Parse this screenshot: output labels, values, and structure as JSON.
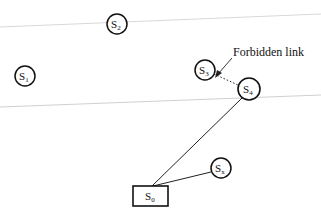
{
  "diagram": {
    "annotation": "Forbidden link",
    "boundaries": [
      {
        "x1": 0,
        "y1": 27,
        "x2": 321,
        "y2": 14,
        "color": "#d8d8d8"
      },
      {
        "x1": 0,
        "y1": 107,
        "x2": 321,
        "y2": 95,
        "color": "#d0d0d0"
      }
    ],
    "nodes": [
      {
        "id": "S2",
        "base": "S",
        "sub": "2",
        "shape": "circle",
        "cx": 117,
        "cy": 24,
        "r": 10
      },
      {
        "id": "S1",
        "base": "S",
        "sub": "1",
        "shape": "circle",
        "cx": 25,
        "cy": 76,
        "r": 10
      },
      {
        "id": "S3",
        "base": "S",
        "sub": "3",
        "shape": "circle",
        "cx": 205,
        "cy": 70,
        "r": 10
      },
      {
        "id": "S4",
        "base": "S",
        "sub": "4",
        "shape": "circle",
        "cx": 249,
        "cy": 89,
        "r": 11
      },
      {
        "id": "Sx",
        "base": "S",
        "sub": "x",
        "shape": "circle",
        "cx": 221,
        "cy": 168,
        "r": 10
      },
      {
        "id": "S0",
        "base": "S",
        "sub": "0",
        "shape": "rect",
        "x": 133,
        "y": 186,
        "w": 35,
        "h": 20
      }
    ],
    "edges": [
      {
        "from": "S3",
        "to": "S4",
        "style": "dotted",
        "label": "Forbidden link"
      },
      {
        "from": "S0",
        "to": "S4",
        "style": "solid"
      },
      {
        "from": "S0",
        "to": "Sx",
        "style": "solid"
      }
    ]
  }
}
